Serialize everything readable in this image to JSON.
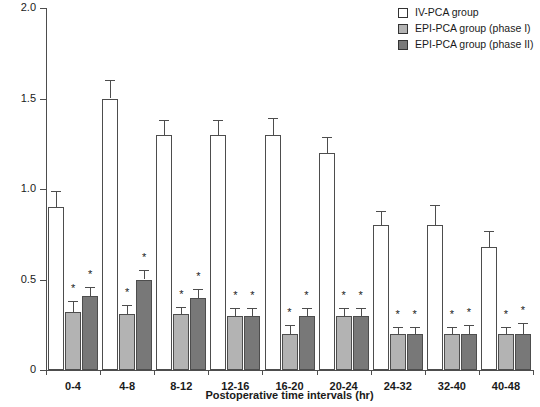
{
  "chart_data": {
    "type": "bar",
    "title": "",
    "xlabel": "Postoperative time intervals (hr)",
    "ylabel": "Hydromorphone (mg/4 hr)",
    "categories": [
      "0-4",
      "4-8",
      "8-12",
      "12-16",
      "16-20",
      "20-24",
      "24-32",
      "32-40",
      "40-48"
    ],
    "ylim": [
      0,
      2.0
    ],
    "yticks": [
      "0",
      "0.5",
      "1.0",
      "1.5",
      "2.0"
    ],
    "ytick_values": [
      0,
      0.5,
      1.0,
      1.5,
      2.0
    ],
    "grid": false,
    "legend_position": "top-right",
    "series": [
      {
        "name": "IV-PCA group",
        "color": "#ffffff",
        "values": [
          0.9,
          1.5,
          1.3,
          1.3,
          1.3,
          1.2,
          0.8,
          0.8,
          0.68
        ],
        "errors": [
          0.09,
          0.1,
          0.08,
          0.08,
          0.09,
          0.09,
          0.08,
          0.11,
          0.09
        ],
        "significance": [
          "",
          "",
          "",
          "",
          "",
          "",
          "",
          "",
          ""
        ]
      },
      {
        "name": "EPI-PCA group (phase I)",
        "color": "#b3b3b3",
        "values": [
          0.32,
          0.31,
          0.31,
          0.3,
          0.2,
          0.3,
          0.2,
          0.2,
          0.2
        ],
        "errors": [
          0.06,
          0.05,
          0.04,
          0.04,
          0.05,
          0.04,
          0.04,
          0.04,
          0.04
        ],
        "significance": [
          "*",
          "*",
          "*",
          "*",
          "*",
          "*",
          "*",
          "*",
          "*"
        ]
      },
      {
        "name": "EPI-PCA group (phase II)",
        "color": "#787878",
        "values": [
          0.41,
          0.5,
          0.4,
          0.3,
          0.3,
          0.3,
          0.2,
          0.2,
          0.2
        ],
        "errors": [
          0.05,
          0.05,
          0.05,
          0.04,
          0.04,
          0.04,
          0.04,
          0.05,
          0.06
        ],
        "significance": [
          "*",
          "*",
          "*",
          "*",
          "*",
          "*",
          "*",
          "*",
          "*"
        ]
      }
    ]
  },
  "legend": {
    "items": [
      {
        "label": "IV-PCA group",
        "color": "#ffffff"
      },
      {
        "label": "EPI-PCA group (phase I)",
        "color": "#b3b3b3"
      },
      {
        "label": "EPI-PCA group (phase II)",
        "color": "#787878"
      }
    ]
  }
}
